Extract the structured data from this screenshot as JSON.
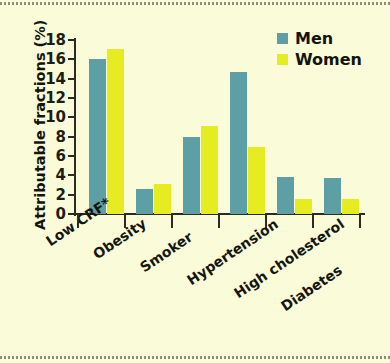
{
  "chart_data": {
    "type": "bar",
    "title": "",
    "xlabel": "",
    "ylabel": "Attributable fractions (%)",
    "ylim": [
      0,
      18
    ],
    "yticks": [
      0,
      2,
      4,
      6,
      8,
      10,
      12,
      14,
      16,
      18
    ],
    "grid": false,
    "legend_position": "top-right",
    "categories": [
      "Low CRF*",
      "Obesity",
      "Smoker",
      "Hypertension",
      "High cholesterol",
      "Diabetes"
    ],
    "series": [
      {
        "name": "Men",
        "color": "#5d9fa4",
        "values": [
          16.0,
          2.6,
          8.0,
          14.7,
          3.8,
          3.7
        ]
      },
      {
        "name": "Women",
        "color": "#e6ec22",
        "values": [
          17.1,
          3.1,
          9.1,
          6.9,
          1.6,
          1.6
        ]
      }
    ]
  },
  "figure": {
    "background_color": "#fafbd8",
    "axis_color": "#2b2b22"
  },
  "legend": {
    "entries": [
      {
        "label": "Men",
        "swatch": "#5d9fa4"
      },
      {
        "label": "Women",
        "swatch": "#e6ec22"
      }
    ]
  }
}
